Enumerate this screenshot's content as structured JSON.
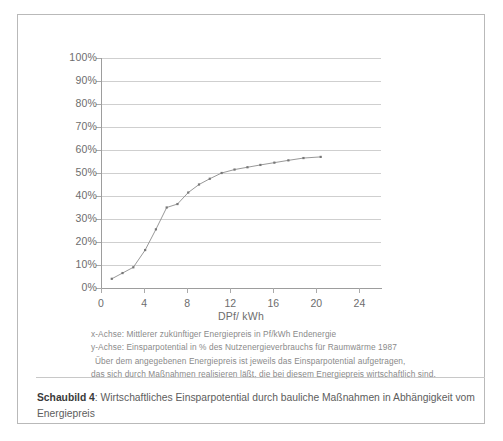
{
  "chart_data": {
    "type": "line",
    "title": "Wirtschaftliches Einsparpotential durch bauliche Maßnahmen in Abhängigkeit vom Energiepreis",
    "xlabel": "DPf/ kWh",
    "ylabel": "",
    "xlim": [
      0,
      26
    ],
    "ylim": [
      0,
      100
    ],
    "grid": true,
    "legend": "none",
    "x_ticks": [
      "0",
      "4",
      "8",
      "12",
      "16",
      "20",
      "24"
    ],
    "x_tick_values": [
      0,
      4,
      8,
      12,
      16,
      20,
      24
    ],
    "y_ticks": [
      "0%",
      "10%",
      "20%",
      "30%",
      "40%",
      "50%",
      "60%",
      "70%",
      "80%",
      "90%",
      "100%"
    ],
    "y_tick_values": [
      0,
      10,
      20,
      30,
      40,
      50,
      60,
      70,
      80,
      90,
      100
    ],
    "series": [
      {
        "name": "Wirtschaftliches Einsparpotential",
        "marker": "small-dot",
        "color": "#8c8c8c",
        "x": [
          1.0,
          2.0,
          3.0,
          4.1,
          5.1,
          6.1,
          7.1,
          8.1,
          9.1,
          10.1,
          11.2,
          12.4,
          13.6,
          14.8,
          16.1,
          17.4,
          18.8,
          20.4
        ],
        "y": [
          4.0,
          6.5,
          9.0,
          16.5,
          25.5,
          35.0,
          36.5,
          41.5,
          45.0,
          47.5,
          50.0,
          51.5,
          52.5,
          53.5,
          54.5,
          55.5,
          56.5,
          57.0
        ]
      }
    ]
  },
  "notes": {
    "line1": "x-Achse: Mittlerer zukünftiger Energiepreis in Pf/kWh Endenergie",
    "line2": "y-Achse: Einsparpotential in % des Nutzenergieverbrauchs für Raumwärme 1987",
    "line3": "Über dem angegebenen  Energiepreis ist jeweils das Einsparpotential aufgetragen,",
    "line4": "das sich durch Maßnahmen realisieren läßt, die bei diesem Energiepreis wirtschaftlich sind."
  },
  "caption": {
    "label": "Schaubild 4",
    "separator": ":",
    "text": "Wirtschaftliches Einsparpotential durch bauliche Maßnahmen in Abhängigkeit vom Energiepreis"
  },
  "colors": {
    "border": "#b9b9b9",
    "grid": "#cfcfcf",
    "axis": "#9d9d9d",
    "series": "#8c8c8c",
    "text": "#6d6d6d"
  }
}
